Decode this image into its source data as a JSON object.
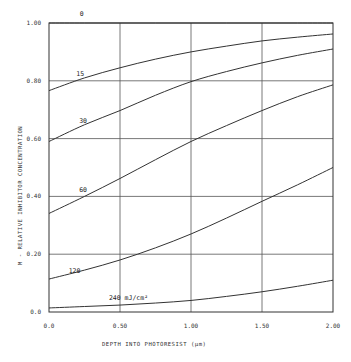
{
  "chart_data": {
    "type": "line",
    "title": "",
    "xlabel": "DEPTH INTO PHOTORESIST (μm)",
    "ylabel": "M - RELATIVE INHIBITOR CONCENTRATION",
    "xlim": [
      0.0,
      2.0
    ],
    "ylim": [
      0.0,
      1.0
    ],
    "grid": true,
    "x_ticks": [
      {
        "value": 0.0,
        "label": "0.0"
      },
      {
        "value": 0.5,
        "label": "0.50"
      },
      {
        "value": 1.0,
        "label": "1.00"
      },
      {
        "value": 1.5,
        "label": "1.50"
      },
      {
        "value": 2.0,
        "label": "2.00"
      }
    ],
    "y_ticks": [
      {
        "value": 0.0,
        "label": "0.0"
      },
      {
        "value": 0.2,
        "label": "0.20"
      },
      {
        "value": 0.4,
        "label": "0.40"
      },
      {
        "value": 0.6,
        "label": "0.60"
      },
      {
        "value": 0.8,
        "label": "0.80"
      },
      {
        "value": 1.0,
        "label": "1.00"
      }
    ],
    "x": [
      0.0,
      0.25,
      0.5,
      0.75,
      1.0,
      1.25,
      1.5,
      1.75,
      2.0
    ],
    "series": [
      {
        "name": "0",
        "label": "0",
        "label_pos": [
          0.23,
          1.025
        ],
        "values": [
          1.0,
          1.0,
          1.0,
          1.0,
          1.0,
          1.0,
          1.0,
          1.0,
          1.0
        ]
      },
      {
        "name": "15",
        "label": "15",
        "label_pos": [
          0.22,
          0.815
        ],
        "values": [
          0.766,
          0.81,
          0.845,
          0.875,
          0.9,
          0.92,
          0.938,
          0.951,
          0.962
        ]
      },
      {
        "name": "30",
        "label": "30",
        "label_pos": [
          0.24,
          0.655
        ],
        "values": [
          0.59,
          0.648,
          0.697,
          0.75,
          0.797,
          0.832,
          0.862,
          0.888,
          0.91
        ]
      },
      {
        "name": "60",
        "label": "60",
        "label_pos": [
          0.24,
          0.415
        ],
        "values": [
          0.341,
          0.4,
          0.462,
          0.527,
          0.59,
          0.645,
          0.697,
          0.745,
          0.786
        ]
      },
      {
        "name": "120",
        "label": "120",
        "label_pos": [
          0.18,
          0.135
        ],
        "values": [
          0.114,
          0.145,
          0.18,
          0.222,
          0.27,
          0.325,
          0.383,
          0.44,
          0.5
        ]
      },
      {
        "name": "240",
        "label": "240 mJ/cm²",
        "label_pos": [
          0.56,
          0.04
        ],
        "values": [
          0.014,
          0.019,
          0.024,
          0.031,
          0.04,
          0.054,
          0.07,
          0.089,
          0.11
        ]
      }
    ],
    "annotations": [
      "0",
      "15",
      "30",
      "60",
      "120",
      "240 mJ/cm²"
    ],
    "legend": "none (curves labeled inline by exposure dose)"
  }
}
